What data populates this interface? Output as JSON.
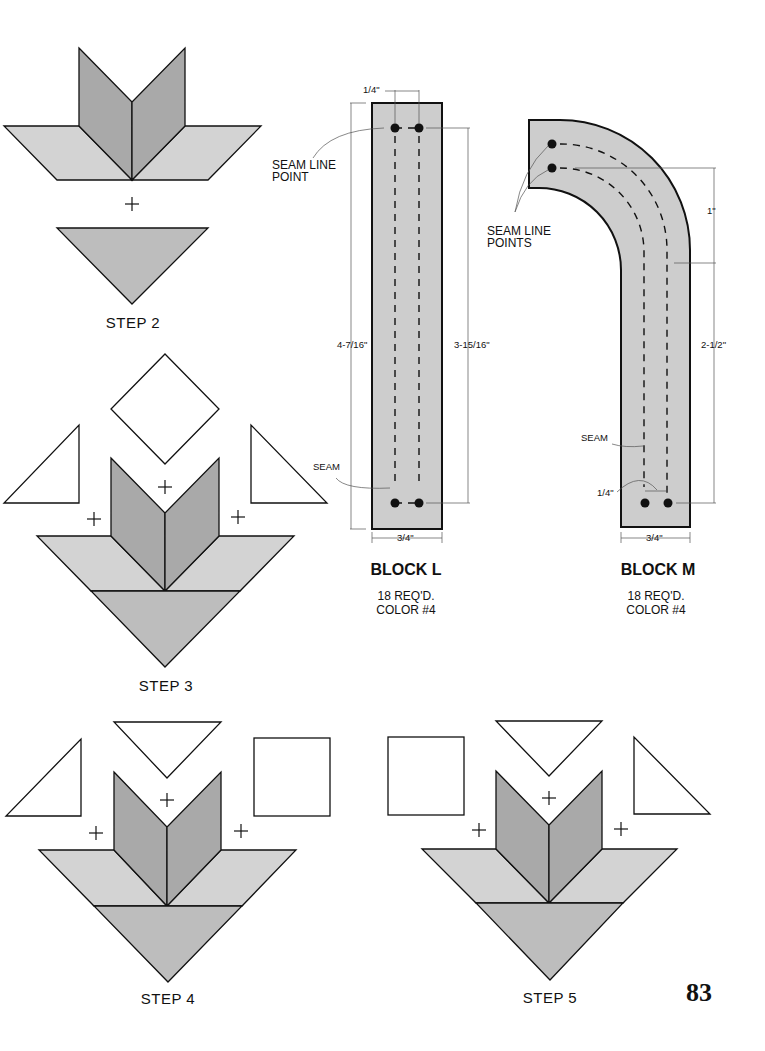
{
  "page": {
    "number": "83"
  },
  "colors": {
    "dark_fill": "#a9a9a9",
    "light_fill": "#d3d3d3",
    "block_fill": "#cdcdcd",
    "stroke": "#111111"
  },
  "steps": [
    {
      "label": "STEP 2"
    },
    {
      "label": "STEP 3"
    },
    {
      "label": "STEP 4"
    },
    {
      "label": "STEP 5"
    }
  ],
  "block_l": {
    "title": "BLOCK L",
    "required": "18 REQ'D.",
    "color": "COLOR #4",
    "seam_line_point_label_1": "SEAM LINE",
    "seam_line_point_label_2": "POINT",
    "seam_label": "SEAM",
    "dim_seam_allowance": "1/4\"",
    "dim_total_length": "4-7/16\"",
    "dim_seam_length": "3-15/16\"",
    "dim_width": "3/4\""
  },
  "block_m": {
    "title": "BLOCK M",
    "required": "18 REQ'D.",
    "color": "COLOR #4",
    "seam_line_points_label_1": "SEAM LINE",
    "seam_line_points_label_2": "POINTS",
    "seam_label": "SEAM",
    "dim_seam_allowance": "1/4\"",
    "dim_curve": "1\"",
    "dim_straight": "2-1/2\"",
    "dim_width": "3/4\""
  },
  "symbols": {
    "plus": "+"
  }
}
